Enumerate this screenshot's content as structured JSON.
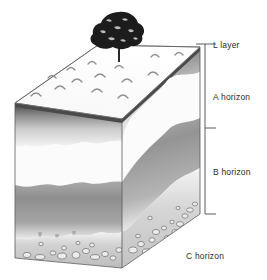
{
  "figure": {
    "background_color": "#ffffff",
    "ink_color": "#2b2b2b"
  },
  "labels": {
    "l_layer": "L layer",
    "a_horizon": "A horizon",
    "b_horizon": "B horizon",
    "c_horizon": "C horizon"
  },
  "bracket": {
    "axis_x": 205,
    "ticks_y": [
      44,
      128,
      214
    ],
    "tick_length": 11,
    "color": "#4a4a4a"
  },
  "horizons": [
    {
      "key": "l_layer",
      "label": "L layer",
      "order": 1,
      "fill": "#4c4c4c",
      "description": "Thin dark organic leaf-litter layer at the very top of the block."
    },
    {
      "key": "a_horizon",
      "label": "A horizon",
      "order": 2,
      "fill": "#e9e9e9",
      "description": "Pale topsoil band beneath the litter, thickening toward the right of the block."
    },
    {
      "key": "b_horizon",
      "label": "B horizon",
      "order": 3,
      "fill": "#9a9a9a",
      "description": "Mid-grey subsoil band with an irregular mottled upper boundary."
    },
    {
      "key": "c_horizon",
      "label": "C horizon",
      "order": 4,
      "fill": "#cfcfcf",
      "description": "Lowest band of weathered parent material containing outlined stones and pebbles."
    }
  ],
  "surface": {
    "litter_marks_count": 13,
    "litter_mark_color": "#8c8c8c",
    "tree": {
      "name": "tree",
      "canopy_color": "#1c1c1c",
      "trunk_color": "#2a2a2a"
    }
  },
  "stones": {
    "outline_color": "#6f6f6f",
    "fill_color": "#e4e4e4",
    "count_front_face": 14,
    "count_right_face": 17
  },
  "icons": {
    "tree": "tree-icon",
    "stone": "stone-icon",
    "litter": "leaf-litter-icon"
  }
}
